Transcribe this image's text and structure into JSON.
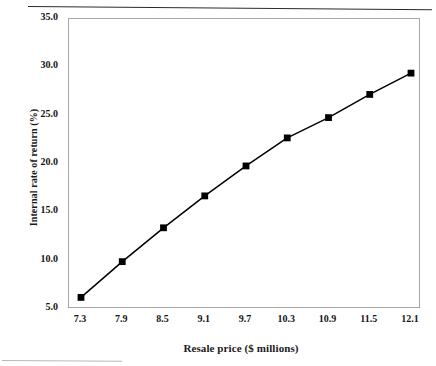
{
  "chart_data": {
    "type": "line",
    "title": "",
    "xlabel": "Resale price ($ millions)",
    "ylabel": "Internal rate of return (%)",
    "xlim": [
      7.3,
      12.1
    ],
    "ylim": [
      5.0,
      35.0
    ],
    "grid": false,
    "legend": "none",
    "marker": "filled-square",
    "line_color": "#000000",
    "marker_color": "#000000",
    "x": [
      7.3,
      7.9,
      8.5,
      9.1,
      9.7,
      10.3,
      10.9,
      11.5,
      12.1
    ],
    "values": [
      6.2,
      9.9,
      13.4,
      16.7,
      19.8,
      22.7,
      24.8,
      27.2,
      29.4
    ],
    "series": [
      {
        "name": "Internal rate of return",
        "values": [
          6.2,
          9.9,
          13.4,
          16.7,
          19.8,
          22.7,
          24.8,
          27.2,
          29.4
        ]
      }
    ],
    "xticks": [
      "7.3",
      "7.9",
      "8.5",
      "9.1",
      "9.7",
      "10.3",
      "10.9",
      "11.5",
      "12.1"
    ],
    "xtick_values": [
      7.3,
      7.9,
      8.5,
      9.1,
      9.7,
      10.3,
      10.9,
      11.5,
      12.1
    ],
    "yticks": [
      "5.0",
      "10.0",
      "15.0",
      "20.0",
      "25.0",
      "30.0",
      "35.0"
    ],
    "ytick_values": [
      5.0,
      10.0,
      15.0,
      20.0,
      25.0,
      30.0,
      35.0
    ],
    "annotations": []
  },
  "axes": {
    "y_title": "Internal rate of return (%)",
    "x_title": "Resale price ($ millions)",
    "frame_color": "#a8a8a8",
    "tick_color": "#8d8d8d"
  }
}
